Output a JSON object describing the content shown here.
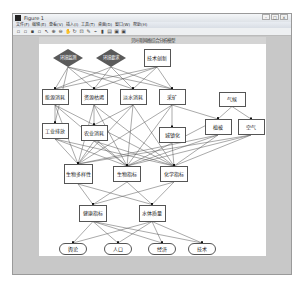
{
  "window": {
    "title": "Figure 1",
    "buttons": [
      "–",
      "□",
      "×"
    ]
  },
  "menu": [
    "文件(F)",
    "编辑(E)",
    "查看(V)",
    "插入(I)",
    "工具(T)",
    "桌面(D)",
    "窗口(W)",
    "帮助(H)"
  ],
  "toolbar": [
    "new-icon",
    "open-icon",
    "save-icon",
    "print-icon",
    "pointer-icon",
    "zoom-in-icon",
    "zoom-out-icon",
    "pan-icon",
    "rotate-icon",
    "datacursor-icon",
    "brush-icon",
    "link-icon",
    "colorbar-icon",
    "legend-icon",
    "hide-icon",
    "show-icon"
  ],
  "toolbar_glyphs": [
    "▫",
    "▫",
    "▪",
    "▫",
    "↖",
    "⊕",
    "⊖",
    "✋",
    "↻",
    "⊡",
    "✎",
    "⌁",
    "▮",
    "▤",
    "▣",
    "▣"
  ],
  "axes": {
    "title": "贝叶斯网络综合分析模型"
  },
  "nodes": [
    {
      "id": "n1",
      "label": "环境监测",
      "shape": "diamond",
      "x": 67,
      "y": 57,
      "w": 30,
      "h": 18
    },
    {
      "id": "n2",
      "label": "环境要求",
      "shape": "diamond",
      "x": 110,
      "y": 57,
      "w": 30,
      "h": 18
    },
    {
      "id": "n3",
      "label": "技术创新",
      "shape": "box",
      "x": 156,
      "y": 57,
      "w": 27,
      "h": 18
    },
    {
      "id": "n4",
      "label": "能源消耗",
      "shape": "box",
      "x": 54,
      "y": 96,
      "w": 27,
      "h": 16
    },
    {
      "id": "n5",
      "label": "资源枯竭",
      "shape": "box",
      "x": 93,
      "y": 96,
      "w": 27,
      "h": 16
    },
    {
      "id": "n6",
      "label": "淡水消耗",
      "shape": "box",
      "x": 132,
      "y": 96,
      "w": 27,
      "h": 16
    },
    {
      "id": "n7",
      "label": "采矿",
      "shape": "box",
      "x": 171,
      "y": 96,
      "w": 27,
      "h": 16
    },
    {
      "id": "n8",
      "label": "气候",
      "shape": "box",
      "x": 231,
      "y": 98,
      "w": 27,
      "h": 15
    },
    {
      "id": "n9",
      "label": "工业排放",
      "shape": "box",
      "x": 54,
      "y": 130,
      "w": 27,
      "h": 16
    },
    {
      "id": "n10",
      "label": "农业消耗",
      "shape": "box",
      "x": 93,
      "y": 132,
      "w": 27,
      "h": 16
    },
    {
      "id": "n11",
      "label": "城镇化",
      "shape": "box",
      "x": 171,
      "y": 134,
      "w": 27,
      "h": 16
    },
    {
      "id": "n12",
      "label": "植被",
      "shape": "box",
      "x": 217,
      "y": 126,
      "w": 27,
      "h": 16
    },
    {
      "id": "n13",
      "label": "空气",
      "shape": "box",
      "x": 250,
      "y": 126,
      "w": 27,
      "h": 16
    },
    {
      "id": "n14",
      "label": "生物多样性",
      "shape": "box",
      "x": 77,
      "y": 173,
      "w": 29,
      "h": 20
    },
    {
      "id": "n15",
      "label": "生物指标",
      "shape": "box",
      "x": 126,
      "y": 173,
      "w": 28,
      "h": 16
    },
    {
      "id": "n16",
      "label": "化学指标",
      "shape": "box",
      "x": 173,
      "y": 173,
      "w": 28,
      "h": 16
    },
    {
      "id": "n17",
      "label": "健康指标",
      "shape": "box",
      "x": 92,
      "y": 212,
      "w": 28,
      "h": 17
    },
    {
      "id": "n18",
      "label": "水体质量",
      "shape": "box",
      "x": 151,
      "y": 212,
      "w": 27,
      "h": 17
    },
    {
      "id": "n19",
      "label": "舆论",
      "shape": "oval",
      "x": 72,
      "y": 248,
      "w": 28,
      "h": 12
    },
    {
      "id": "n20",
      "label": "人口",
      "shape": "oval",
      "x": 117,
      "y": 248,
      "w": 28,
      "h": 12
    },
    {
      "id": "n21",
      "label": "经济",
      "shape": "oval",
      "x": 161,
      "y": 248,
      "w": 28,
      "h": 12
    },
    {
      "id": "n22",
      "label": "技术",
      "shape": "oval",
      "x": 201,
      "y": 248,
      "w": 28,
      "h": 12
    }
  ],
  "edges": [
    [
      "n1",
      "n4"
    ],
    [
      "n1",
      "n5"
    ],
    [
      "n1",
      "n6"
    ],
    [
      "n1",
      "n7"
    ],
    [
      "n1",
      "n9"
    ],
    [
      "n2",
      "n4"
    ],
    [
      "n2",
      "n5"
    ],
    [
      "n2",
      "n6"
    ],
    [
      "n2",
      "n7"
    ],
    [
      "n3",
      "n4"
    ],
    [
      "n3",
      "n5"
    ],
    [
      "n3",
      "n6"
    ],
    [
      "n3",
      "n7"
    ],
    [
      "n4",
      "n9"
    ],
    [
      "n4",
      "n14"
    ],
    [
      "n4",
      "n15"
    ],
    [
      "n4",
      "n16"
    ],
    [
      "n5",
      "n10"
    ],
    [
      "n5",
      "n14"
    ],
    [
      "n5",
      "n15"
    ],
    [
      "n5",
      "n16"
    ],
    [
      "n6",
      "n14"
    ],
    [
      "n6",
      "n15"
    ],
    [
      "n6",
      "n16"
    ],
    [
      "n6",
      "n10"
    ],
    [
      "n7",
      "n11"
    ],
    [
      "n7",
      "n12"
    ],
    [
      "n7",
      "n15"
    ],
    [
      "n7",
      "n14"
    ],
    [
      "n8",
      "n12"
    ],
    [
      "n8",
      "n13"
    ],
    [
      "n9",
      "n14"
    ],
    [
      "n9",
      "n15"
    ],
    [
      "n9",
      "n16"
    ],
    [
      "n10",
      "n14"
    ],
    [
      "n10",
      "n15"
    ],
    [
      "n10",
      "n16"
    ],
    [
      "n11",
      "n12"
    ],
    [
      "n11",
      "n16"
    ],
    [
      "n11",
      "n15"
    ],
    [
      "n12",
      "n14"
    ],
    [
      "n12",
      "n15"
    ],
    [
      "n12",
      "n16"
    ],
    [
      "n13",
      "n14"
    ],
    [
      "n13",
      "n15"
    ],
    [
      "n13",
      "n16"
    ],
    [
      "n14",
      "n17"
    ],
    [
      "n14",
      "n18"
    ],
    [
      "n15",
      "n17"
    ],
    [
      "n15",
      "n18"
    ],
    [
      "n16",
      "n17"
    ],
    [
      "n16",
      "n18"
    ],
    [
      "n17",
      "n19"
    ],
    [
      "n17",
      "n20"
    ],
    [
      "n17",
      "n21"
    ],
    [
      "n17",
      "n22"
    ],
    [
      "n18",
      "n19"
    ],
    [
      "n18",
      "n20"
    ],
    [
      "n18",
      "n21"
    ],
    [
      "n18",
      "n22"
    ]
  ],
  "colors": {
    "diamond": "#5a5a5a",
    "edge": "#555555",
    "arrow": "#111111"
  }
}
